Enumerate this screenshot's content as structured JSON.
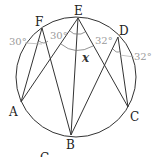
{
  "figure": {
    "type": "inscribed-angles-circle",
    "points": {
      "A": {
        "label": "A"
      },
      "B": {
        "label": "B"
      },
      "C": {
        "label": "C"
      },
      "D": {
        "label": "D"
      },
      "E": {
        "label": "E"
      },
      "F": {
        "label": "F"
      }
    },
    "angles": {
      "at_F": "30°",
      "at_E_left": "30°",
      "at_E_right": "32°",
      "at_D": "32°",
      "unknown": "x"
    },
    "caption_partial": "C"
  }
}
